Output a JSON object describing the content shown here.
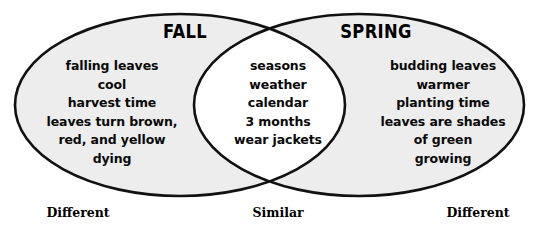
{
  "diagram": {
    "type": "venn",
    "sets": [
      {
        "id": "fall",
        "title": "FALL",
        "region_label": "Different",
        "items": [
          "falling leaves",
          "cool",
          "harvest time",
          "leaves turn brown,\nred, and yellow",
          "dying"
        ]
      },
      {
        "id": "spring",
        "title": "SPRING",
        "region_label": "Different",
        "items": [
          "budding leaves",
          "warmer",
          "planting time",
          "leaves are shades\nof green",
          "growing"
        ]
      }
    ],
    "intersection": {
      "id": "similar",
      "region_label": "Similar",
      "items": [
        "seasons",
        "weather",
        "calendar",
        "3 months",
        "wear jackets"
      ]
    },
    "colors": {
      "set_fill": "#ededed",
      "intersection_fill": "#ffffff",
      "outline": "#111111",
      "text": "#0a0a0a",
      "background": "#ffffff"
    }
  }
}
